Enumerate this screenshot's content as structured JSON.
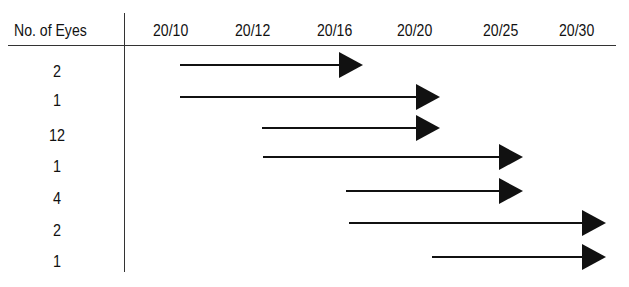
{
  "header": {
    "row_label": "No. of Eyes",
    "columns": [
      "20/10",
      "20/12",
      "20/16",
      "20/20",
      "20/25",
      "20/30"
    ]
  },
  "rows": [
    {
      "eyes": "2",
      "from": "20/10",
      "to": "20/16"
    },
    {
      "eyes": "1",
      "from": "20/10",
      "to": "20/20"
    },
    {
      "eyes": "12",
      "from": "20/12",
      "to": "20/20"
    },
    {
      "eyes": "1",
      "from": "20/12",
      "to": "20/25"
    },
    {
      "eyes": "4",
      "from": "20/16",
      "to": "20/25"
    },
    {
      "eyes": "2",
      "from": "20/16",
      "to": "20/30"
    },
    {
      "eyes": "1",
      "from": "20/20",
      "to": "20/30"
    }
  ],
  "colors": {
    "ink": "#111111",
    "background": "#ffffff"
  }
}
